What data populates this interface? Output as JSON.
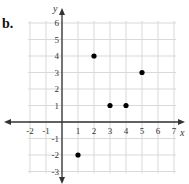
{
  "part_label": "b.",
  "chart_data": {
    "type": "scatter",
    "title": "",
    "xlabel": "x",
    "ylabel": "y",
    "xlim": [
      -2,
      7
    ],
    "ylim": [
      -3,
      6
    ],
    "grid": true,
    "x_ticks": [
      -2,
      -1,
      1,
      2,
      3,
      4,
      5,
      6,
      7
    ],
    "y_ticks": [
      6,
      5,
      4,
      3,
      2,
      1,
      -1,
      -2,
      -3
    ],
    "points": [
      {
        "x": 2,
        "y": 4
      },
      {
        "x": 5,
        "y": 3
      },
      {
        "x": 3,
        "y": 1
      },
      {
        "x": 4,
        "y": 1
      },
      {
        "x": 1,
        "y": -2
      }
    ]
  },
  "colors": {
    "grid": "#d9d9d9",
    "axis": "#333333",
    "point": "#000000",
    "text": "#333333"
  }
}
